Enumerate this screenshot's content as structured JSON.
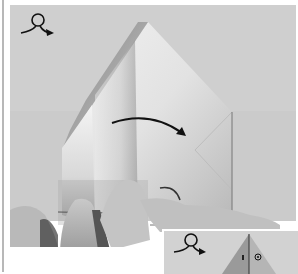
{
  "image": {
    "description": "Origami instruction photograph: hands folding a white paper into a house/pentagon shape, with a curved arrow indicating a fold to the right; turnover symbol top-left; inset photo bottom-right showing the next step with a turnover symbol.",
    "main_photo": {
      "symbol": "turn-over-symbol",
      "arrow": "fold-arrow-right",
      "background_color": "#cfcfcf",
      "paper_color": "#eeeeee"
    },
    "inset_photo": {
      "symbol": "turn-over-symbol",
      "markers": [
        "crease-mark",
        "circle-dot-mark"
      ],
      "background_color": "#d2d2d2"
    }
  }
}
